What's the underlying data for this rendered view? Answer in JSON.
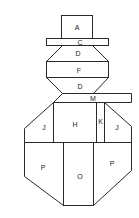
{
  "diagram": {
    "title": "",
    "labels": {
      "hat_top": "A",
      "hat_brim": "C",
      "head_upper": "D",
      "head_middle": "F",
      "head_lower": "D",
      "scarf": "M",
      "body_center_top": "H",
      "body_strip": "K",
      "body_left_top": "J",
      "body_right_top": "J",
      "body_left_bottom": "P",
      "body_center_bottom": "O",
      "body_right_bottom": "P"
    },
    "colors": {
      "line": "#2a2a2a",
      "background": "#ffffff"
    }
  }
}
